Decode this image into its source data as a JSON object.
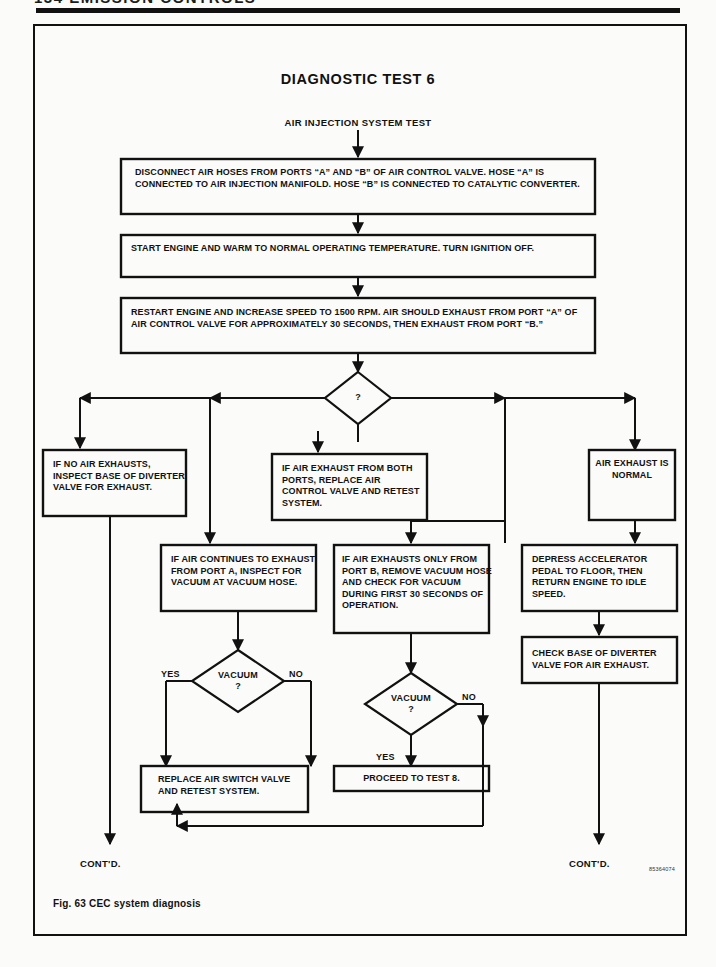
{
  "page": {
    "header_text": "134   EMISSION CONTROLS",
    "part_code": "85364074"
  },
  "figure": {
    "title": "DIAGNOSTIC TEST 6",
    "subtitle": "AIR INJECTION SYSTEM TEST",
    "caption": "Fig. 63  CEC system diagnosis"
  },
  "flow": {
    "step1": "DISCONNECT AIR HOSES FROM PORTS “A” AND “B” OF AIR CONTROL VALVE.\nHOSE “A” IS CONNECTED TO AIR INJECTION MANIFOLD.\nHOSE “B” IS CONNECTED TO CATALYTIC CONVERTER.",
    "step2": "START ENGINE AND WARM TO NORMAL OPERATING TEMPERATURE. TURN IGNITION\nOFF.",
    "step3": "RESTART ENGINE AND INCREASE SPEED TO 1500 RPM. AIR SHOULD EXHAUST FROM\nPORT “A” OF AIR CONTROL VALVE FOR APPROXIMATELY 30 SECONDS, THEN EXHAUST\nFROM PORT “B.”",
    "decision_main": "?",
    "branch_a": "IF NO AIR EXHAUSTS,\nINSPECT BASE OF\nDIVERTER VALVE FOR\nEXHAUST.",
    "branch_b": "IF AIR EXHAUST FROM\nBOTH PORTS, REPLACE AIR\nCONTROL VALVE AND\nRETEST SYSTEM.",
    "branch_c": "AIR\nEXHAUST\nIS\nNORMAL",
    "branch_d": "IF AIR CONTINUES TO\nEXHAUST FROM PORT A,\nINSPECT FOR VACUUM AT\nVACUUM HOSE.",
    "branch_e": "IF AIR EXHAUSTS ONLY\nFROM PORT B, REMOVE\nVACUUM HOSE AND CHECK\nFOR VACUUM DURING\nFIRST 30 SECONDS OF\nOPERATION.",
    "branch_f": "DEPRESS ACCELERATOR\nPEDAL TO FLOOR, THEN\nRETURN ENGINE TO IDLE\nSPEED.",
    "branch_g": "CHECK BASE OF DIVERTER\nVALVE FOR AIR EXHAUST.",
    "vacuum_1": "VACUUM",
    "vacuum_1_q": "?",
    "vacuum_2": "VACUUM",
    "vacuum_2_q": "?",
    "yes_1": "YES",
    "no_1": "NO",
    "yes_2": "YES",
    "no_2": "NO",
    "result_replace": "REPLACE AIR SWITCH\nVALVE AND RETEST\nSYSTEM.",
    "result_proceed": "PROCEED TO TEST 8.",
    "contd_left": "CONT'D.",
    "contd_right": "CONT'D."
  },
  "colors": {
    "ink": "#111111",
    "paper": "#fbfbf9"
  }
}
